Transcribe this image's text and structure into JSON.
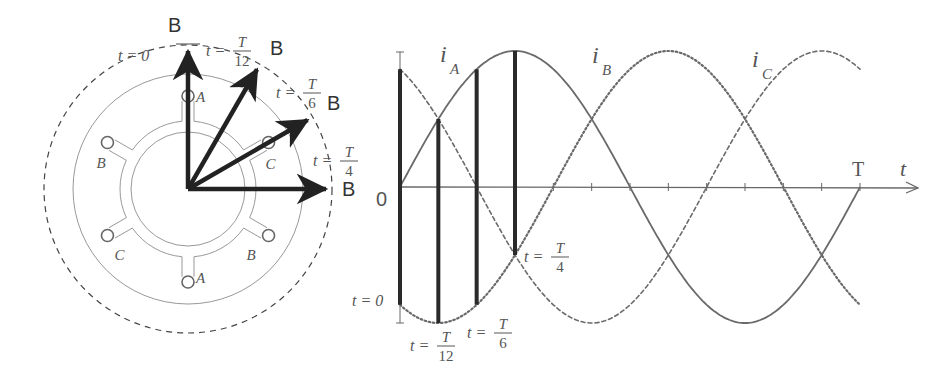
{
  "figure": {
    "left_panel": {
      "title": "rotating-field-vector-diagram",
      "center": [
        188,
        189
      ],
      "radii": {
        "rotor_inner": 57,
        "stator_bore": 68,
        "slot_ring": 93,
        "stator_outer": 115,
        "field_path": 144
      },
      "slot_radius": 6,
      "slots": [
        {
          "label": "A",
          "angle_deg": 90
        },
        {
          "label": "C",
          "angle_deg": 30
        },
        {
          "label": "B",
          "angle_deg": 150
        },
        {
          "label": "C",
          "angle_deg": 210
        },
        {
          "label": "B",
          "angle_deg": -30
        },
        {
          "label": "A",
          "angle_deg": 270
        }
      ],
      "vectors": [
        {
          "symbol": "B",
          "time_label": "t = 0",
          "num": "",
          "den": "",
          "angle_deg": 90
        },
        {
          "symbol": "B",
          "time_label": "t =",
          "num": "T",
          "den": "12",
          "angle_deg": 60
        },
        {
          "symbol": "B",
          "time_label": "t =",
          "num": "T",
          "den": "6",
          "angle_deg": 30
        },
        {
          "symbol": "B",
          "time_label": "t =",
          "num": "T",
          "den": "4",
          "angle_deg": 0
        }
      ],
      "colors": {
        "stator": "#999999",
        "field_path": "#444444",
        "vector": "#222222",
        "text": "#555555"
      }
    },
    "right_panel": {
      "title": "three-phase-current-waveforms",
      "origin_label": "0",
      "axis_label": "t",
      "period_label": "T",
      "series_labels": {
        "iA": "i",
        "iA_sub": "A",
        "iB": "i",
        "iB_sub": "B",
        "iC": "i",
        "iC_sub": "C"
      },
      "time_markers": [
        {
          "label": "t = 0",
          "num": "",
          "den": ""
        },
        {
          "label": "t =",
          "num": "T",
          "den": "12"
        },
        {
          "label": "t =",
          "num": "T",
          "den": "6"
        },
        {
          "label": "t =",
          "num": "T",
          "den": "4"
        }
      ]
    }
  },
  "chart_data": {
    "type": "line",
    "xlabel": "t",
    "ylabel": "",
    "x_range": [
      0,
      1
    ],
    "x_unit": "T",
    "ylim": [
      -1,
      1
    ],
    "x_ticks": [
      "0",
      "T/12",
      "T/6",
      "T/4",
      "T/3",
      "5T/12",
      "T/2",
      "7T/12",
      "2T/3",
      "3T/4",
      "5T/6",
      "11T/12",
      "T"
    ],
    "series": [
      {
        "name": "iA",
        "style": "solid",
        "formula": "sin(2πt/T)",
        "phase_deg": 0
      },
      {
        "name": "iB",
        "style": "dotted",
        "formula": "sin(2πt/T − 120°)",
        "phase_deg": -120
      },
      {
        "name": "iC",
        "style": "dashed",
        "formula": "sin(2πt/T + 120°)",
        "phase_deg": 120
      }
    ],
    "highlighted_instants": [
      {
        "t": "0",
        "iA": 0,
        "iB": -0.866,
        "iC": 0.866
      },
      {
        "t": "T/12",
        "iA": 0.5,
        "iB": -1.0,
        "iC": 0.5
      },
      {
        "t": "T/6",
        "iA": 0.866,
        "iB": -0.866,
        "iC": 0
      },
      {
        "t": "T/4",
        "iA": 1.0,
        "iB": -0.5,
        "iC": -0.5
      }
    ],
    "grid": false,
    "legend": "inline labels"
  },
  "plot_geometry": {
    "x0": 400,
    "x1": 860,
    "y0": 187,
    "amp": 136,
    "axis_end": 918
  }
}
